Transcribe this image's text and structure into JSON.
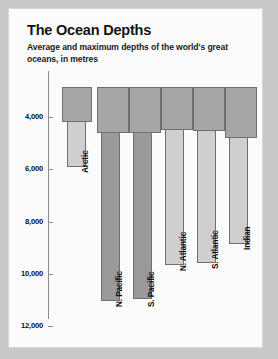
{
  "card": {
    "title": "The Ocean Depths",
    "subtitle": "Average and maximum depths of the world's great oceans, in metres"
  },
  "chart_data": {
    "type": "bar",
    "title": "The Ocean Depths",
    "subtitle": "Average and maximum depths of the world's great oceans, in metres",
    "xlabel": "",
    "ylabel": "",
    "ylim": [
      0,
      12000
    ],
    "y_axis_inverted": true,
    "grid": false,
    "legend": "none",
    "units": "metres",
    "yticks": [
      4000,
      6000,
      8000,
      10000,
      12000
    ],
    "ytick_labels": [
      "4,000",
      "6,000",
      "8,000",
      "10,000",
      "12,000"
    ],
    "categories": [
      "Arctic",
      "N. Pacific",
      "S. Pacific",
      "N. Atlantic",
      "S. Atlantic",
      "Indian"
    ],
    "series": [
      {
        "name": "Average depth",
        "values": [
          1330,
          4280,
          4280,
          3280,
          3420,
          3890
        ]
      },
      {
        "name": "Maximum depth",
        "values": [
          5450,
          11030,
          10880,
          8600,
          8430,
          7450
        ]
      }
    ]
  },
  "bars": [
    {
      "label": "Arctic",
      "outer": {
        "left": 53,
        "top": 78,
        "width": 30,
        "height": 35
      },
      "inner": {
        "left": 58,
        "top": 78,
        "width": 19,
        "height": 80,
        "shade": "light"
      },
      "label_pos": {
        "left": 72,
        "top": 164
      }
    },
    {
      "label": "N. Pacific",
      "outer": {
        "left": 88,
        "top": 78,
        "width": 32,
        "height": 46
      },
      "inner": {
        "left": 92,
        "top": 78,
        "width": 19,
        "height": 214,
        "shade": "dark"
      },
      "label_pos": {
        "left": 106,
        "top": 298
      }
    },
    {
      "label": "S. Pacific",
      "outer": {
        "left": 120,
        "top": 78,
        "width": 32,
        "height": 46
      },
      "inner": {
        "left": 124,
        "top": 78,
        "width": 19,
        "height": 212,
        "shade": "dark"
      },
      "label_pos": {
        "left": 138,
        "top": 298
      }
    },
    {
      "label": "N. Atlantic",
      "outer": {
        "left": 152,
        "top": 78,
        "width": 32,
        "height": 43
      },
      "inner": {
        "left": 156,
        "top": 78,
        "width": 19,
        "height": 178,
        "shade": "light"
      },
      "label_pos": {
        "left": 170,
        "top": 262
      }
    },
    {
      "label": "S. Atlantic",
      "outer": {
        "left": 184,
        "top": 78,
        "width": 32,
        "height": 44
      },
      "inner": {
        "left": 188,
        "top": 78,
        "width": 19,
        "height": 176,
        "shade": "light"
      },
      "label_pos": {
        "left": 202,
        "top": 260
      }
    },
    {
      "label": "Indian",
      "outer": {
        "left": 216,
        "top": 78,
        "width": 32,
        "height": 51
      },
      "inner": {
        "left": 220,
        "top": 78,
        "width": 19,
        "height": 157,
        "shade": "light"
      },
      "label_pos": {
        "left": 234,
        "top": 241
      }
    }
  ],
  "axis": {
    "ticks": [
      {
        "label": "4,000",
        "y": 108
      },
      {
        "label": "6,000",
        "y": 160
      },
      {
        "label": "8,000",
        "y": 213
      },
      {
        "label": "10,000",
        "y": 265
      },
      {
        "label": "12,000",
        "y": 317
      }
    ]
  },
  "colors": {
    "page_background": "#c9c9c9",
    "card_background": "#fbfbfb",
    "bar_fill": "#a6a6a6",
    "bar_fill_light": "#cfcfcf",
    "bar_fill_dark": "#9a9a9a",
    "bar_stroke": "#6f6f6f",
    "axis": "#8d8d8d",
    "text": "#101010"
  }
}
